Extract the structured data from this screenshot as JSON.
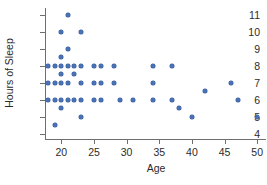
{
  "chart_data": {
    "type": "scatter",
    "title": "",
    "xlabel": "Age",
    "ylabel": "Hours of Sleep",
    "xlim": [
      17.5,
      51.5
    ],
    "ylim": [
      3.7,
      11.4
    ],
    "xticks": [
      20,
      25,
      30,
      35,
      40,
      45,
      50
    ],
    "yticks": [
      4,
      5,
      6,
      7,
      8,
      9,
      10,
      11
    ],
    "grid": false,
    "legend": null,
    "marker_color": "#4a72b5",
    "axis_color": "#6e6e6e",
    "text_color": "#2b2b2b",
    "points": [
      {
        "x": 21,
        "y": 11
      },
      {
        "x": 20,
        "y": 10
      },
      {
        "x": 23,
        "y": 10
      },
      {
        "x": 21,
        "y": 9
      },
      {
        "x": 20,
        "y": 8.5
      },
      {
        "x": 18,
        "y": 8
      },
      {
        "x": 19,
        "y": 8
      },
      {
        "x": 20,
        "y": 8
      },
      {
        "x": 21,
        "y": 8
      },
      {
        "x": 22,
        "y": 8
      },
      {
        "x": 23,
        "y": 8
      },
      {
        "x": 25,
        "y": 8
      },
      {
        "x": 26,
        "y": 8
      },
      {
        "x": 28,
        "y": 8
      },
      {
        "x": 34,
        "y": 8
      },
      {
        "x": 37,
        "y": 8
      },
      {
        "x": 20,
        "y": 7.5
      },
      {
        "x": 22,
        "y": 7.5
      },
      {
        "x": 18,
        "y": 7
      },
      {
        "x": 19,
        "y": 7
      },
      {
        "x": 20,
        "y": 7
      },
      {
        "x": 21,
        "y": 7
      },
      {
        "x": 23,
        "y": 7
      },
      {
        "x": 25,
        "y": 7
      },
      {
        "x": 26,
        "y": 7
      },
      {
        "x": 28,
        "y": 7
      },
      {
        "x": 34,
        "y": 7
      },
      {
        "x": 46,
        "y": 7
      },
      {
        "x": 42,
        "y": 6.5
      },
      {
        "x": 18,
        "y": 6
      },
      {
        "x": 19,
        "y": 6
      },
      {
        "x": 20,
        "y": 6
      },
      {
        "x": 21,
        "y": 6
      },
      {
        "x": 22,
        "y": 6
      },
      {
        "x": 23,
        "y": 6
      },
      {
        "x": 25,
        "y": 6
      },
      {
        "x": 26,
        "y": 6
      },
      {
        "x": 29,
        "y": 6
      },
      {
        "x": 31,
        "y": 6
      },
      {
        "x": 34,
        "y": 6
      },
      {
        "x": 37,
        "y": 6
      },
      {
        "x": 47,
        "y": 6
      },
      {
        "x": 20,
        "y": 5.5
      },
      {
        "x": 38,
        "y": 5.5
      },
      {
        "x": 23,
        "y": 5
      },
      {
        "x": 40,
        "y": 5
      },
      {
        "x": 50,
        "y": 5
      },
      {
        "x": 19,
        "y": 4.5
      }
    ]
  }
}
